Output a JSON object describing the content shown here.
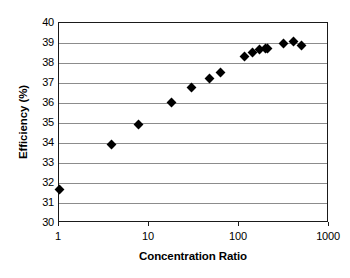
{
  "figure": {
    "background_color": "#ffffff",
    "frame_color": "#1a1a1a",
    "grid_color": "#8c8c8c",
    "marker_color": "#000000"
  },
  "caption": {
    "text": ""
  },
  "chart_data": {
    "type": "scatter",
    "title": "",
    "xlabel": "Concentration Ratio",
    "ylabel": "Efficiency (%)",
    "xscale": "log",
    "yscale": "linear",
    "xlim": [
      1,
      1000
    ],
    "ylim": [
      30,
      40
    ],
    "grid": true,
    "grid_axis": "y",
    "legend": false,
    "marker": "diamond",
    "xticks": [
      1,
      10,
      100,
      1000
    ],
    "xtick_labels": [
      "1",
      "10",
      "100",
      "1000"
    ],
    "yticks": [
      30,
      31,
      32,
      33,
      34,
      35,
      36,
      37,
      38,
      39,
      40
    ],
    "ytick_labels": [
      "30",
      "31",
      "32",
      "33",
      "34",
      "35",
      "36",
      "37",
      "38",
      "39",
      "40"
    ],
    "series": [
      {
        "name": "Efficiency",
        "x": [
          1.0,
          3.8,
          7.6,
          18,
          30,
          47,
          62,
          115,
          140,
          170,
          195,
          205,
          310,
          400,
          500
        ],
        "y": [
          31.7,
          33.95,
          34.95,
          36.05,
          36.8,
          37.25,
          37.55,
          38.35,
          38.55,
          38.7,
          38.75,
          38.75,
          39.0,
          39.1,
          38.9
        ]
      }
    ]
  }
}
